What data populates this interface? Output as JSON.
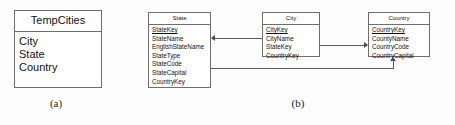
{
  "figure": {
    "background_color": "#fdfdfd",
    "line_color": "#5a5a5a",
    "text_color": "#111111"
  },
  "panel_a": {
    "caption": "(a)",
    "table": {
      "title": "TempCities",
      "fields": [
        {
          "name": "City",
          "primary_key": false
        },
        {
          "name": "State",
          "primary_key": false
        },
        {
          "name": "Country",
          "primary_key": false
        }
      ]
    }
  },
  "panel_b": {
    "caption": "(b)",
    "tables": [
      {
        "title": "State",
        "fields": [
          {
            "name": "StateKey",
            "primary_key": true
          },
          {
            "name": "StateName",
            "primary_key": false
          },
          {
            "name": "EnglishStateName",
            "primary_key": false
          },
          {
            "name": "StateType",
            "primary_key": false
          },
          {
            "name": "StateCode",
            "primary_key": false
          },
          {
            "name": "StateCapital",
            "primary_key": false
          },
          {
            "name": "CountryKey",
            "primary_key": false
          }
        ]
      },
      {
        "title": "City",
        "fields": [
          {
            "name": "CityKey",
            "primary_key": true
          },
          {
            "name": "CityName",
            "primary_key": false
          },
          {
            "name": "StateKey",
            "primary_key": false
          },
          {
            "name": "CountryKey",
            "primary_key": false
          }
        ]
      },
      {
        "title": "Country",
        "fields": [
          {
            "name": "CountryKey",
            "primary_key": true
          },
          {
            "name": "CountyName",
            "primary_key": false
          },
          {
            "name": "CountryCode",
            "primary_key": false
          },
          {
            "name": "CountryCapital",
            "primary_key": false
          }
        ]
      }
    ],
    "relationships": [
      {
        "from": "City",
        "to": "State",
        "direction": "left"
      },
      {
        "from": "City",
        "to": "Country",
        "direction": "right"
      },
      {
        "from": "State",
        "to": "Country",
        "direction": "up"
      }
    ]
  }
}
